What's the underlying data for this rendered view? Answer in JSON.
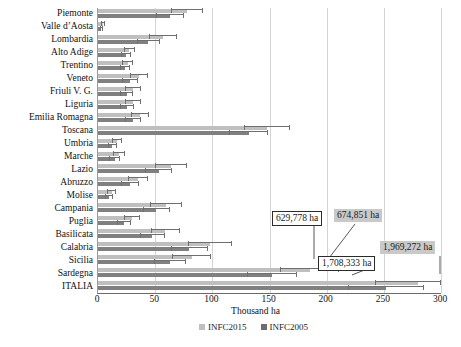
{
  "chart_data": {
    "type": "bar",
    "orientation": "horizontal",
    "title": "",
    "xlabel": "Thousand ha",
    "ylabel": "",
    "xlim": [
      0,
      300
    ],
    "xticks": [
      0,
      50,
      100,
      150,
      200,
      250,
      300
    ],
    "grid": true,
    "legend_position": "bottom-center",
    "categories": [
      "Piemonte",
      "Valle d’Aosta",
      "Lombardia",
      "Alto Adige",
      "Trentino",
      "Veneto",
      "Friuli V. G.",
      "Liguria",
      "Emilia Romagna",
      "Toscana",
      "Umbria",
      "Marche",
      "Lazio",
      "Abruzzo",
      "Molise",
      "Campania",
      "Puglia",
      "Basilicata",
      "Calabria",
      "Sicilia",
      "Sardegna",
      "ITALIA"
    ],
    "series": [
      {
        "name": "INFC2015",
        "color": "#bfbfbf",
        "values": [
          78.0,
          4.5,
          57.0,
          27.5,
          26.0,
          36.0,
          30.5,
          31.0,
          37.0,
          148.0,
          16.5,
          18.5,
          64.0,
          35.0,
          12.0,
          59.5,
          30.0,
          59.0,
          98.0,
          82.0,
          185.0,
          280.0
        ],
        "errors": [
          14.0,
          2.0,
          12.0,
          5.0,
          5.0,
          8.0,
          7.0,
          7.0,
          8.0,
          20.0,
          4.5,
          5.0,
          14.0,
          9.0,
          4.0,
          14.0,
          7.0,
          13.0,
          19.0,
          17.0,
          26.0,
          38.0
        ]
      },
      {
        "name": "INFC2005",
        "color": "#808080",
        "values": [
          63.0,
          3.0,
          44.0,
          24.5,
          23.5,
          28.0,
          25.0,
          25.5,
          31.0,
          132.0,
          12.5,
          14.5,
          53.0,
          28.0,
          9.5,
          51.0,
          23.0,
          47.5,
          80.0,
          63.0,
          152.0,
          252.0
        ],
        "errors": [
          12.0,
          1.5,
          10.0,
          4.5,
          4.5,
          7.0,
          6.0,
          6.0,
          7.0,
          17.0,
          4.0,
          4.5,
          12.0,
          8.0,
          3.5,
          12.0,
          6.0,
          11.0,
          16.0,
          14.0,
          22.0,
          33.0
        ]
      }
    ],
    "annotations": [
      {
        "text": "629,778 ha",
        "style": "boxed"
      },
      {
        "text": "674,851 ha",
        "style": "shaded"
      },
      {
        "text": "1,708,333 ha",
        "style": "boxed"
      },
      {
        "text": "1,969,272 ha",
        "style": "shaded"
      }
    ]
  }
}
